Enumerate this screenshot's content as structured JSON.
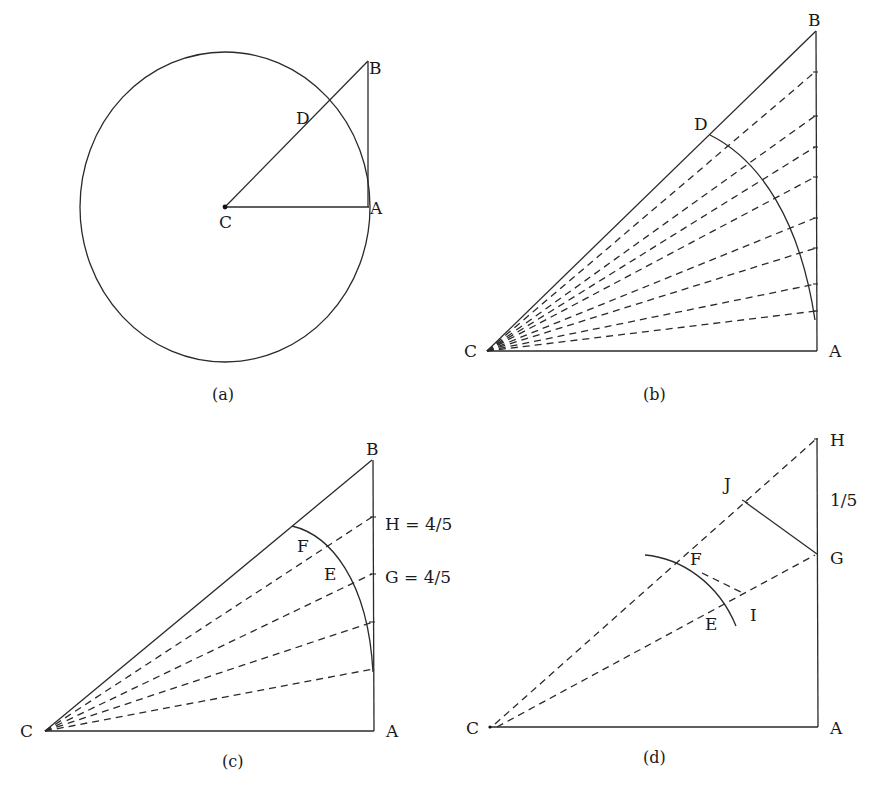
{
  "figure": {
    "panels": [
      {
        "id": "a",
        "caption": "(a)",
        "labels": {
          "B": "B",
          "D": "D",
          "C": "C",
          "A": "A"
        },
        "points": {
          "C": [
            225,
            207
          ],
          "A": [
            369,
            207
          ],
          "B": [
            368,
            61
          ]
        },
        "circle": {
          "cx": 225,
          "cy": 207,
          "rx": 145,
          "ry": 155
        }
      },
      {
        "id": "b",
        "caption": "(b)",
        "labels": {
          "B": "B",
          "D": "D",
          "C": "C",
          "A": "A"
        },
        "points": {
          "C": [
            487,
            351
          ],
          "A": [
            816,
            351
          ],
          "B": [
            816,
            31
          ],
          "D": [
            710,
            135
          ]
        },
        "dashed_targets_y": [
          72,
          116,
          147,
          177,
          218,
          248,
          284,
          311
        ],
        "arc_end": [
          815,
          320
        ]
      },
      {
        "id": "c",
        "caption": "(c)",
        "labels": {
          "B": "B",
          "F": "F",
          "E": "E",
          "C": "C",
          "A": "A",
          "H": "H = 4/5",
          "G": "G = 4/5"
        },
        "points": {
          "C": [
            45,
            731
          ],
          "A": [
            373,
            731
          ],
          "B": [
            373,
            460
          ],
          "arc_start": [
            292,
            526
          ],
          "arc_end": [
            373,
            672
          ]
        },
        "dashed_targets_y": [
          517,
          574,
          622,
          669
        ]
      },
      {
        "id": "d",
        "caption": "(d)",
        "labels": {
          "H": "H",
          "J": "J",
          "segment": "1/5",
          "F": "F",
          "G": "G",
          "E": "E",
          "I": "I",
          "C": "C",
          "A": "A"
        },
        "points": {
          "C": [
            490,
            727
          ],
          "A": [
            818,
            727
          ],
          "H": [
            817,
            438
          ],
          "G": [
            817,
            554
          ],
          "J": [
            745,
            502
          ],
          "arc_start": [
            645,
            555
          ],
          "arc_end": [
            736,
            626
          ],
          "arc_pt": [
            702,
            573
          ],
          "I": [
            745,
            594
          ]
        }
      }
    ]
  }
}
